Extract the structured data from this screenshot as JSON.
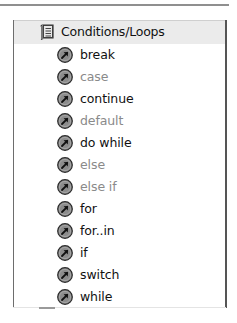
{
  "category": {
    "label": "Conditions/Loops",
    "icon": "book-icon"
  },
  "items": [
    {
      "label": "break",
      "enabled": true,
      "icon": "action-arrow-icon"
    },
    {
      "label": "case",
      "enabled": false,
      "icon": "action-arrow-icon"
    },
    {
      "label": "continue",
      "enabled": true,
      "icon": "action-arrow-icon"
    },
    {
      "label": "default",
      "enabled": false,
      "icon": "action-arrow-icon"
    },
    {
      "label": "do while",
      "enabled": true,
      "icon": "action-arrow-icon"
    },
    {
      "label": "else",
      "enabled": false,
      "icon": "action-arrow-icon"
    },
    {
      "label": "else if",
      "enabled": false,
      "icon": "action-arrow-icon"
    },
    {
      "label": "for",
      "enabled": true,
      "icon": "action-arrow-icon"
    },
    {
      "label": "for..in",
      "enabled": true,
      "icon": "action-arrow-icon"
    },
    {
      "label": "if",
      "enabled": true,
      "icon": "action-arrow-icon"
    },
    {
      "label": "switch",
      "enabled": true,
      "icon": "action-arrow-icon"
    },
    {
      "label": "while",
      "enabled": true,
      "icon": "action-arrow-icon"
    }
  ],
  "colors": {
    "enabled_text": "#111111",
    "disabled_text": "#8a8a8a",
    "header_bg": "#ebebeb",
    "icon_fill": "#8c8c8c"
  }
}
